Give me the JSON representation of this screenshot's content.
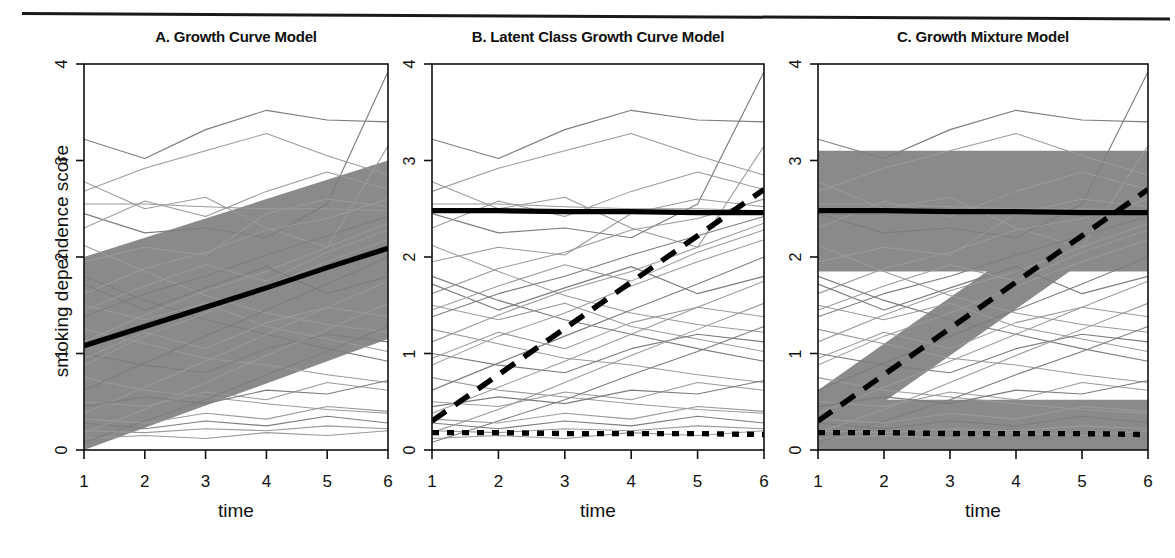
{
  "figure": {
    "ylabel": "smoking dependence score",
    "rule_name": "top-horizontal-rule"
  },
  "panels": [
    {
      "title": "A. Growth Curve Model",
      "xlabel": "time",
      "ylabel": "smoking dependence score"
    },
    {
      "title": "B. Latent Class Growth Curve Model",
      "xlabel": "time",
      "ylabel": ""
    },
    {
      "title": "C. Growth Mixture Model",
      "xlabel": "time",
      "ylabel": ""
    }
  ],
  "axis": {
    "yticks": [
      "0",
      "1",
      "2",
      "3",
      "4"
    ],
    "ytick_values": [
      0,
      1,
      2,
      3,
      4
    ],
    "xticks": [
      "1",
      "2",
      "3",
      "4",
      "5",
      "6"
    ],
    "xtick_values": [
      1,
      2,
      3,
      4,
      5,
      6
    ],
    "xlim": [
      1,
      6
    ],
    "ylim": [
      0,
      4
    ]
  },
  "colors": {
    "band_gray": "#8a8a8a",
    "spaghetti_gray": "#9a9a9a",
    "mean_black": "#000000",
    "frame_black": "#111111",
    "background": "#ffffff"
  },
  "chart_data": [
    {
      "type": "line",
      "title": "A. Growth Curve Model",
      "xlabel": "time",
      "ylabel": "smoking dependence score",
      "xlim": [
        1,
        6
      ],
      "ylim": [
        0,
        4
      ],
      "x": [
        1,
        2,
        3,
        4,
        5,
        6
      ],
      "grid": false,
      "legend": "none",
      "series": [
        {
          "name": "population mean trajectory",
          "style": "solid-thick-black",
          "values": [
            1.08,
            1.28,
            1.48,
            1.68,
            1.89,
            2.09
          ]
        }
      ],
      "bands": [
        {
          "name": "individual variability band",
          "style": "gray-fill",
          "upper": [
            2.0,
            2.2,
            2.4,
            2.6,
            2.8,
            3.0
          ],
          "lower": [
            0.0,
            0.23,
            0.46,
            0.69,
            0.92,
            1.15
          ]
        }
      ],
      "spaghetti_note": "≈30 light-gray observed individual trajectories plotted behind the band",
      "spaghetti": [
        [
          3.22,
          3.02,
          3.32,
          3.52,
          3.42,
          3.4
        ],
        [
          2.78,
          2.5,
          2.62,
          2.3,
          2.1,
          3.15
        ],
        [
          2.55,
          2.55,
          2.52,
          2.5,
          2.5,
          2.48
        ],
        [
          2.45,
          2.25,
          2.3,
          2.2,
          2.55,
          3.92
        ],
        [
          2.12,
          1.85,
          1.6,
          1.42,
          1.3,
          1.22
        ],
        [
          1.95,
          2.1,
          2.02,
          2.45,
          2.6,
          2.52
        ],
        [
          1.8,
          1.55,
          1.35,
          1.2,
          1.05,
          0.92
        ],
        [
          1.62,
          1.88,
          2.05,
          2.28,
          2.4,
          2.6
        ],
        [
          1.5,
          1.35,
          1.52,
          1.28,
          1.15,
          1.02
        ],
        [
          1.38,
          1.62,
          1.8,
          2.02,
          2.22,
          2.42
        ],
        [
          1.25,
          1.1,
          0.95,
          0.88,
          0.78,
          0.7
        ],
        [
          1.12,
          1.4,
          1.65,
          1.85,
          2.1,
          2.35
        ],
        [
          1.0,
          0.88,
          0.8,
          1.05,
          1.2,
          1.12
        ],
        [
          0.88,
          1.18,
          1.42,
          1.7,
          1.95,
          2.18
        ],
        [
          0.75,
          0.62,
          0.55,
          0.48,
          0.42,
          0.38
        ],
        [
          0.62,
          0.9,
          1.18,
          1.45,
          1.72,
          2.0
        ],
        [
          0.5,
          0.45,
          0.6,
          0.52,
          0.7,
          0.62
        ],
        [
          0.38,
          0.65,
          0.92,
          1.2,
          1.48,
          1.75
        ],
        [
          0.28,
          0.22,
          0.3,
          0.25,
          0.35,
          0.28
        ],
        [
          0.18,
          0.42,
          0.7,
          0.98,
          1.25,
          1.52
        ],
        [
          0.12,
          0.15,
          0.12,
          0.18,
          0.15,
          0.2
        ],
        [
          0.08,
          0.3,
          0.52,
          0.78,
          1.02,
          1.28
        ],
        [
          0.2,
          0.18,
          0.22,
          0.2,
          0.25,
          0.22
        ],
        [
          0.32,
          0.28,
          0.38,
          0.32,
          0.45,
          0.4
        ],
        [
          0.45,
          0.55,
          0.48,
          0.62,
          0.58,
          0.72
        ],
        [
          2.3,
          2.58,
          2.42,
          2.68,
          2.88,
          2.7
        ],
        [
          2.68,
          2.92,
          3.1,
          3.28,
          3.05,
          2.85
        ],
        [
          1.72,
          1.45,
          1.68,
          1.9,
          1.62,
          1.8
        ],
        [
          0.95,
          1.22,
          1.05,
          1.32,
          1.48,
          1.38
        ],
        [
          1.45,
          1.7,
          1.92,
          1.75,
          2.05,
          2.28
        ]
      ]
    },
    {
      "type": "line",
      "title": "B. Latent Class Growth Curve Model",
      "xlabel": "time",
      "ylabel": "",
      "xlim": [
        1,
        6
      ],
      "ylim": [
        0,
        4
      ],
      "x": [
        1,
        2,
        3,
        4,
        5,
        6
      ],
      "grid": false,
      "legend": "none",
      "series": [
        {
          "name": "class 1 - stable high",
          "style": "solid-thick-black",
          "values": [
            2.48,
            2.48,
            2.47,
            2.47,
            2.46,
            2.46
          ]
        },
        {
          "name": "class 2 - rapid increasers",
          "style": "long-dashed-black",
          "values": [
            0.3,
            0.78,
            1.26,
            1.74,
            2.22,
            2.7
          ]
        },
        {
          "name": "class 3 - stable low",
          "style": "dotted-black",
          "values": [
            0.18,
            0.18,
            0.17,
            0.17,
            0.17,
            0.16
          ]
        }
      ],
      "bands": [],
      "spaghetti_note": "≈30 light-gray observed individual trajectories, no variance bands around class means",
      "spaghetti": [
        [
          3.22,
          3.02,
          3.32,
          3.52,
          3.42,
          3.4
        ],
        [
          2.78,
          2.5,
          2.62,
          2.3,
          2.1,
          3.15
        ],
        [
          2.55,
          2.55,
          2.52,
          2.5,
          2.5,
          2.48
        ],
        [
          2.45,
          2.25,
          2.3,
          2.2,
          2.55,
          3.92
        ],
        [
          2.12,
          1.85,
          1.6,
          1.42,
          1.3,
          1.22
        ],
        [
          1.95,
          2.1,
          2.02,
          2.45,
          2.6,
          2.52
        ],
        [
          1.8,
          1.55,
          1.35,
          1.2,
          1.05,
          0.92
        ],
        [
          1.62,
          1.88,
          2.05,
          2.28,
          2.4,
          2.6
        ],
        [
          1.5,
          1.35,
          1.52,
          1.28,
          1.15,
          1.02
        ],
        [
          1.38,
          1.62,
          1.8,
          2.02,
          2.22,
          2.42
        ],
        [
          1.25,
          1.1,
          0.95,
          0.88,
          0.78,
          0.7
        ],
        [
          1.12,
          1.4,
          1.65,
          1.85,
          2.1,
          2.35
        ],
        [
          1.0,
          0.88,
          0.8,
          1.05,
          1.2,
          1.12
        ],
        [
          0.88,
          1.18,
          1.42,
          1.7,
          1.95,
          2.18
        ],
        [
          0.75,
          0.62,
          0.55,
          0.48,
          0.42,
          0.38
        ],
        [
          0.62,
          0.9,
          1.18,
          1.45,
          1.72,
          2.0
        ],
        [
          0.5,
          0.45,
          0.6,
          0.52,
          0.7,
          0.62
        ],
        [
          0.38,
          0.65,
          0.92,
          1.2,
          1.48,
          1.75
        ],
        [
          0.28,
          0.22,
          0.3,
          0.25,
          0.35,
          0.28
        ],
        [
          0.18,
          0.42,
          0.7,
          0.98,
          1.25,
          1.52
        ],
        [
          0.12,
          0.15,
          0.12,
          0.18,
          0.15,
          0.2
        ],
        [
          0.08,
          0.3,
          0.52,
          0.78,
          1.02,
          1.28
        ],
        [
          0.2,
          0.18,
          0.22,
          0.2,
          0.25,
          0.22
        ],
        [
          0.32,
          0.28,
          0.38,
          0.32,
          0.45,
          0.4
        ],
        [
          0.45,
          0.55,
          0.48,
          0.62,
          0.58,
          0.72
        ],
        [
          2.3,
          2.58,
          2.42,
          2.68,
          2.88,
          2.7
        ],
        [
          2.68,
          2.92,
          3.1,
          3.28,
          3.05,
          2.85
        ],
        [
          1.72,
          1.45,
          1.68,
          1.9,
          1.62,
          1.8
        ],
        [
          0.95,
          1.22,
          1.05,
          1.32,
          1.48,
          1.38
        ],
        [
          1.45,
          1.7,
          1.92,
          1.75,
          2.05,
          2.28
        ]
      ]
    },
    {
      "type": "line",
      "title": "C. Growth Mixture Model",
      "xlabel": "time",
      "ylabel": "",
      "xlim": [
        1,
        6
      ],
      "ylim": [
        0,
        4
      ],
      "x": [
        1,
        2,
        3,
        4,
        5,
        6
      ],
      "grid": false,
      "legend": "none",
      "series": [
        {
          "name": "class 1 - stable high",
          "style": "solid-thick-black",
          "values": [
            2.48,
            2.48,
            2.47,
            2.47,
            2.46,
            2.46
          ]
        },
        {
          "name": "class 2 - rapid increasers",
          "style": "long-dashed-black",
          "values": [
            0.3,
            0.78,
            1.26,
            1.74,
            2.22,
            2.7
          ]
        },
        {
          "name": "class 3 - stable low",
          "style": "dotted-black",
          "values": [
            0.18,
            0.18,
            0.17,
            0.17,
            0.17,
            0.16
          ]
        }
      ],
      "bands": [
        {
          "name": "class 1 variability band",
          "style": "gray-fill",
          "upper": [
            3.1,
            3.1,
            3.1,
            3.1,
            3.1,
            3.1
          ],
          "lower": [
            1.85,
            1.85,
            1.85,
            1.85,
            1.85,
            1.85
          ]
        },
        {
          "name": "class 2 variability band",
          "style": "gray-fill",
          "upper": [
            0.62,
            1.1,
            1.58,
            2.06,
            2.54,
            3.02
          ],
          "lower": [
            0.02,
            0.5,
            0.98,
            1.46,
            1.94,
            2.42
          ]
        },
        {
          "name": "class 3 variability band",
          "style": "gray-fill",
          "upper": [
            0.52,
            0.52,
            0.52,
            0.52,
            0.52,
            0.52
          ],
          "lower": [
            -0.05,
            -0.05,
            -0.05,
            -0.05,
            -0.05,
            -0.05
          ]
        }
      ],
      "spaghetti_note": "≈30 light-gray observed individual trajectories with class-specific variance bands",
      "spaghetti": [
        [
          3.22,
          3.02,
          3.32,
          3.52,
          3.42,
          3.4
        ],
        [
          2.78,
          2.5,
          2.62,
          2.3,
          2.1,
          3.15
        ],
        [
          2.55,
          2.55,
          2.52,
          2.5,
          2.5,
          2.48
        ],
        [
          2.45,
          2.25,
          2.3,
          2.2,
          2.55,
          3.92
        ],
        [
          2.12,
          1.85,
          1.6,
          1.42,
          1.3,
          1.22
        ],
        [
          1.95,
          2.1,
          2.02,
          2.45,
          2.6,
          2.52
        ],
        [
          1.8,
          1.55,
          1.35,
          1.2,
          1.05,
          0.92
        ],
        [
          1.62,
          1.88,
          2.05,
          2.28,
          2.4,
          2.6
        ],
        [
          1.5,
          1.35,
          1.52,
          1.28,
          1.15,
          1.02
        ],
        [
          1.38,
          1.62,
          1.8,
          2.02,
          2.22,
          2.42
        ],
        [
          1.25,
          1.1,
          0.95,
          0.88,
          0.78,
          0.7
        ],
        [
          1.12,
          1.4,
          1.65,
          1.85,
          2.1,
          2.35
        ],
        [
          1.0,
          0.88,
          0.8,
          1.05,
          1.2,
          1.12
        ],
        [
          0.88,
          1.18,
          1.42,
          1.7,
          1.95,
          2.18
        ],
        [
          0.75,
          0.62,
          0.55,
          0.48,
          0.42,
          0.38
        ],
        [
          0.62,
          0.9,
          1.18,
          1.45,
          1.72,
          2.0
        ],
        [
          0.5,
          0.45,
          0.6,
          0.52,
          0.7,
          0.62
        ],
        [
          0.38,
          0.65,
          0.92,
          1.2,
          1.48,
          1.75
        ],
        [
          0.28,
          0.22,
          0.3,
          0.25,
          0.35,
          0.28
        ],
        [
          0.18,
          0.42,
          0.7,
          0.98,
          1.25,
          1.52
        ],
        [
          0.12,
          0.15,
          0.12,
          0.18,
          0.15,
          0.2
        ],
        [
          0.08,
          0.3,
          0.52,
          0.78,
          1.02,
          1.28
        ],
        [
          0.2,
          0.18,
          0.22,
          0.2,
          0.25,
          0.22
        ],
        [
          0.32,
          0.28,
          0.38,
          0.32,
          0.45,
          0.4
        ],
        [
          0.45,
          0.55,
          0.48,
          0.62,
          0.58,
          0.72
        ],
        [
          2.3,
          2.58,
          2.42,
          2.68,
          2.88,
          2.7
        ],
        [
          2.68,
          2.92,
          3.1,
          3.28,
          3.05,
          2.85
        ],
        [
          1.72,
          1.45,
          1.68,
          1.9,
          1.62,
          1.8
        ],
        [
          0.95,
          1.22,
          1.05,
          1.32,
          1.48,
          1.38
        ],
        [
          1.45,
          1.7,
          1.92,
          1.75,
          2.05,
          2.28
        ]
      ]
    }
  ]
}
